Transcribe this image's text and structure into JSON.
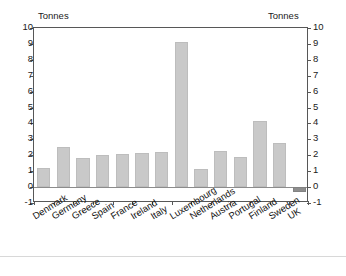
{
  "axis_titles": {
    "left_unit": "Tonnes",
    "right_unit": "Tonnes"
  },
  "chart_data": {
    "type": "bar",
    "title": "",
    "subtitle": "",
    "xlabel": "",
    "ylabel": "Tonnes",
    "ylabel_right": "Tonnes",
    "ylim": [
      -1,
      10
    ],
    "ytick_step": 1,
    "yticks": [
      10,
      9,
      8,
      7,
      6,
      5,
      4,
      3,
      2,
      1,
      0,
      -1
    ],
    "ytick_labels": [
      "10",
      "9",
      "8",
      "7",
      "6",
      "5",
      "4",
      "3",
      "2",
      "1",
      "0",
      "-1"
    ],
    "grid": false,
    "legend": "none",
    "dual_axis": true,
    "zero_line": true,
    "categories": [
      "Denmark",
      "Germany",
      "Greece",
      "Spain",
      "France",
      "Ireland",
      "Italy",
      "Luxembourg",
      "Netherlands",
      "Austria",
      "Portugal",
      "Finland",
      "Sweden",
      "UK"
    ],
    "values": [
      1.2,
      2.5,
      1.85,
      2.0,
      2.1,
      2.15,
      2.2,
      9.1,
      1.15,
      2.25,
      1.9,
      4.15,
      2.75,
      -0.3
    ],
    "colors": {
      "bar_positive": "#c9c9c9",
      "bar_negative": "#8e8e8e",
      "bar_border": "#bdbdbd",
      "axis": "#575757",
      "text": "#1b1b1b",
      "background": "#ffffff"
    }
  }
}
